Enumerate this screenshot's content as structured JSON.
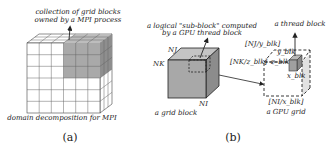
{
  "panel_a": {
    "caption": "(a)",
    "top_label_line1": "collection of grid blocks",
    "top_label_line2": "owned by a MPI process",
    "bottom_label": "domain decomposition for MPI",
    "grid_size": 6
  },
  "panel_b": {
    "caption": "(b)",
    "subblock_label_line1": "a logical \"sub-block\" computed",
    "subblock_label_line2": "by a GPU thread block",
    "grid_block_label": "a grid block",
    "axis_nj": "NJ",
    "axis_nk": "NK",
    "axis_ni": "NI",
    "thread_block_label": "a thread block",
    "gpu_grid_label": "a GPU grid",
    "nj_div": "[NJ/y_blk]",
    "nk_div": "[NK/z_blk]",
    "ni_div": "[NI/x_blk]",
    "y_blk": "y_blk",
    "z_blk": "z_blk",
    "x_blk": "x_blk"
  },
  "colors": {
    "cube_front": "#a8a8a8",
    "cube_top": "#c4c4c4",
    "cube_side": "#8c8c8c",
    "highlight": "#b0b0b0",
    "line": "#222222"
  }
}
